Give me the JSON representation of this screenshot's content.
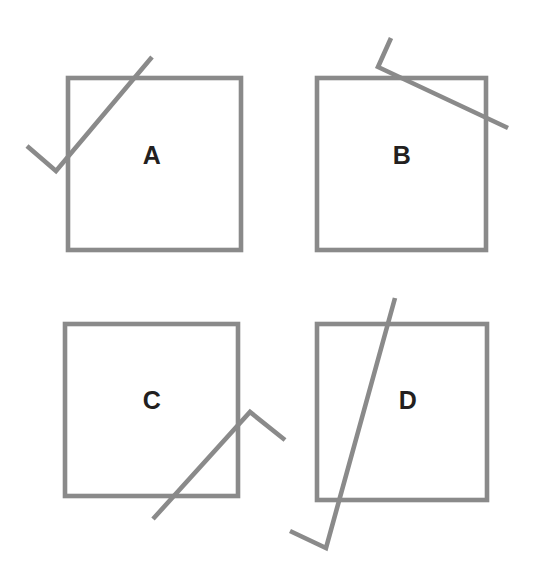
{
  "figure": {
    "width": 533,
    "height": 584,
    "background_color": "#ffffff",
    "stroke_color": "#8a8a8a",
    "stroke_width": 4.6,
    "label_color": "#231f20",
    "label_font_size": 25
  },
  "panels": [
    {
      "label": "A",
      "label_x": 152,
      "label_y": 155,
      "square": {
        "x": 68,
        "y": 78,
        "width": 173,
        "height": 172
      },
      "polyline_points": "27,146 56,171 152,57",
      "polyline_vertices": [
        {
          "x": 27,
          "y": 146
        },
        {
          "x": 56,
          "y": 171
        },
        {
          "x": 152,
          "y": 57
        }
      ],
      "description": "Bent line enters lower-left corner region, vertex outside square at lower left, long arm rises to upper right exiting above the top edge"
    },
    {
      "label": "B",
      "label_x": 402,
      "label_y": 155,
      "square": {
        "x": 317,
        "y": 78,
        "width": 169,
        "height": 172
      },
      "polyline_points": "391,38 378,67 508,128",
      "polyline_vertices": [
        {
          "x": 391,
          "y": 38
        },
        {
          "x": 378,
          "y": 67
        },
        {
          "x": 508,
          "y": 128
        }
      ],
      "description": "Short arm above the square bends at a vertex just above the top edge, long arm descends to the right crossing the right edge"
    },
    {
      "label": "C",
      "label_x": 152,
      "label_y": 400,
      "square": {
        "x": 65,
        "y": 324,
        "width": 173,
        "height": 172
      },
      "polyline_points": "153,519 250,412 285,440",
      "polyline_vertices": [
        {
          "x": 153,
          "y": 519
        },
        {
          "x": 250,
          "y": 412
        },
        {
          "x": 285,
          "y": 440
        }
      ],
      "description": "Long arm rises from below the bottom edge to an apex outside the right edge, then a short arm descends to the right"
    },
    {
      "label": "D",
      "label_x": 408,
      "label_y": 400,
      "square": {
        "x": 317,
        "y": 324,
        "width": 170,
        "height": 176
      },
      "polyline_points": "395,298 326,548 290,531",
      "polyline_vertices": [
        {
          "x": 395,
          "y": 298
        },
        {
          "x": 326,
          "y": 548
        },
        {
          "x": 290,
          "y": 531
        }
      ],
      "description": "Long steep arm crosses the square from above the top edge down through the bottom edge, vertex below the square, short arm goes up to the left"
    }
  ]
}
